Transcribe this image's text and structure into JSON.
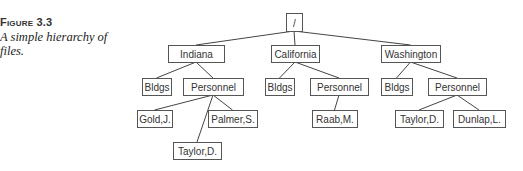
{
  "caption": {
    "label": "Figure 3.3",
    "text": "A simple hierarchy of files."
  },
  "tree": {
    "nodes": [
      {
        "id": "root",
        "label": "/",
        "x": 286,
        "y": 13,
        "w": 16,
        "h": 18
      },
      {
        "id": "indiana",
        "label": "Indiana",
        "x": 168,
        "y": 45,
        "w": 56,
        "h": 17
      },
      {
        "id": "california",
        "label": "California",
        "x": 271,
        "y": 45,
        "w": 48,
        "h": 17
      },
      {
        "id": "washington",
        "label": "Washington",
        "x": 381,
        "y": 45,
        "w": 59,
        "h": 17
      },
      {
        "id": "in-bldgs",
        "label": "Bldgs",
        "x": 142,
        "y": 78,
        "w": 29,
        "h": 17
      },
      {
        "id": "in-personnel",
        "label": "Personnel",
        "x": 183,
        "y": 78,
        "w": 60,
        "h": 17
      },
      {
        "id": "ca-bldgs",
        "label": "Bldgs",
        "x": 265,
        "y": 78,
        "w": 29,
        "h": 17
      },
      {
        "id": "ca-personnel",
        "label": "Personnel",
        "x": 310,
        "y": 78,
        "w": 58,
        "h": 17
      },
      {
        "id": "wa-bldgs",
        "label": "Bldgs",
        "x": 381,
        "y": 78,
        "w": 31,
        "h": 17
      },
      {
        "id": "wa-personnel",
        "label": "Personnel",
        "x": 428,
        "y": 78,
        "w": 58,
        "h": 17
      },
      {
        "id": "gold",
        "label": "Gold,J.",
        "x": 137,
        "y": 110,
        "w": 35,
        "h": 17
      },
      {
        "id": "palmer",
        "label": "Palmer,S.",
        "x": 208,
        "y": 110,
        "w": 49,
        "h": 17
      },
      {
        "id": "in-taylor",
        "label": "Taylor,D.",
        "x": 173,
        "y": 142,
        "w": 48,
        "h": 17
      },
      {
        "id": "raab",
        "label": "Raab,M.",
        "x": 312,
        "y": 110,
        "w": 45,
        "h": 17
      },
      {
        "id": "wa-taylor",
        "label": "Taylor,D.",
        "x": 395,
        "y": 110,
        "w": 48,
        "h": 17
      },
      {
        "id": "dunlap",
        "label": "Dunlap,L.",
        "x": 453,
        "y": 110,
        "w": 52,
        "h": 17
      }
    ],
    "edges": [
      [
        "root",
        "indiana"
      ],
      [
        "root",
        "california"
      ],
      [
        "root",
        "washington"
      ],
      [
        "indiana",
        "in-bldgs"
      ],
      [
        "indiana",
        "in-personnel"
      ],
      [
        "california",
        "ca-bldgs"
      ],
      [
        "california",
        "ca-personnel"
      ],
      [
        "washington",
        "wa-bldgs"
      ],
      [
        "washington",
        "wa-personnel"
      ],
      [
        "in-personnel",
        "gold"
      ],
      [
        "in-personnel",
        "palmer"
      ],
      [
        "in-personnel",
        "in-taylor"
      ],
      [
        "ca-personnel",
        "raab"
      ],
      [
        "wa-personnel",
        "wa-taylor"
      ],
      [
        "wa-personnel",
        "dunlap"
      ]
    ]
  }
}
